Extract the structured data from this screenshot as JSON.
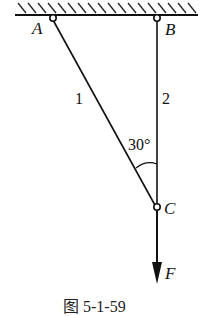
{
  "diagram": {
    "points": {
      "A": {
        "label": "A"
      },
      "B": {
        "label": "B"
      },
      "C": {
        "label": "C"
      }
    },
    "members": [
      {
        "id": "1",
        "label": "1",
        "from": "A",
        "to": "C"
      },
      {
        "id": "2",
        "label": "2",
        "from": "B",
        "to": "C"
      }
    ],
    "angle": {
      "label": "30°",
      "between": [
        "1",
        "2"
      ],
      "at": "C"
    },
    "force": {
      "label": "F",
      "direction": "down",
      "at": "C"
    },
    "support": "fixed ceiling (hatched)",
    "caption": "图 5-1-59"
  }
}
